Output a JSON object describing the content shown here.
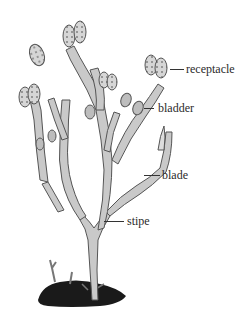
{
  "diagram": {
    "colors": {
      "thallus_fill": "#c9c9c9",
      "thallus_stroke": "#555555",
      "receptacle_fill": "#d8d8d8",
      "holdfast": "#1a1a1a",
      "label_text": "#2b2b2b"
    },
    "labels": [
      {
        "id": "receptacle",
        "text": "receptacle"
      },
      {
        "id": "bladder",
        "text": "bladder"
      },
      {
        "id": "blade",
        "text": "blade"
      },
      {
        "id": "stipe",
        "text": "stipe"
      }
    ]
  }
}
